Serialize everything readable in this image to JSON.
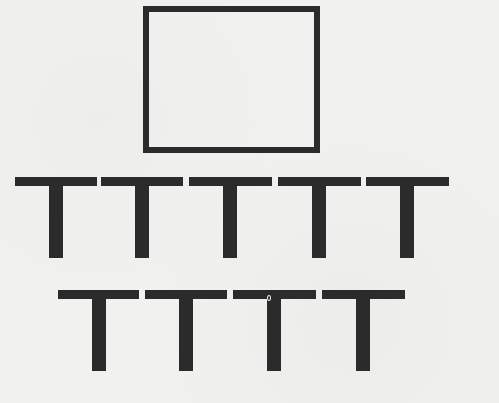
{
  "figure": {
    "ink_color": "#2b2b2b",
    "background_color": "#f1f1f0",
    "rectangle": {
      "x": 143,
      "y": 6,
      "width": 177,
      "height": 147,
      "border": 6
    },
    "t_geometry": {
      "bar_width": 82,
      "bar_height": 9,
      "stem_width": 14,
      "stem_height": 72,
      "stem_offset": 34
    },
    "rows": [
      {
        "label": "top-row",
        "count": 5,
        "y": 177,
        "x_positions": [
          15,
          101,
          189,
          278,
          366
        ]
      },
      {
        "label": "bottom-row",
        "count": 4,
        "y": 290,
        "x_positions": [
          58,
          145,
          233,
          322
        ]
      }
    ],
    "speck": {
      "x": 267,
      "y": 294
    }
  }
}
